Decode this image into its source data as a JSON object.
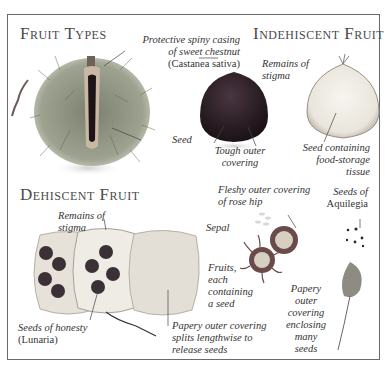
{
  "sections": {
    "fruit_types": {
      "title": "Fruit Types",
      "labels": {
        "casing_line1": "Protective spiny casing",
        "casing_line2": "of sweet chestnut",
        "casing_latin": "(Castanea sativa)",
        "seed": "Seed"
      }
    },
    "indehiscent": {
      "title": "Indehiscent Fruit",
      "labels": {
        "stigma_line1": "Remains of",
        "stigma_line2": "stigma",
        "tough_line1": "Tough outer",
        "tough_line2": "covering",
        "seedfood_line1": "Seed containing",
        "seedfood_line2": "food-storage",
        "seedfood_line3": "tissue"
      }
    },
    "dehiscent": {
      "title": "Dehiscent Fruit",
      "labels": {
        "stigma_line1": "Remains of",
        "stigma_line2": "stigma",
        "honesty_line1": "Seeds of honesty",
        "honesty_latin": "(Lunaria)",
        "papery_line1": "Papery outer covering",
        "papery_line2": "splits lengthwise to",
        "papery_line3": "release seeds"
      }
    },
    "rosehip": {
      "labels": {
        "fleshy_line1": "Fleshy outer covering",
        "fleshy_line2": "of rose hip",
        "sepal": "Sepal",
        "fruits_line1": "Fruits,",
        "fruits_line2": "each",
        "fruits_line3": "containing",
        "fruits_line4": "a seed"
      }
    },
    "aquilegia": {
      "labels": {
        "seeds_line1": "Seeds of",
        "seeds_line2": "Aquilegia",
        "papery_line1": "Papery",
        "papery_line2": "outer",
        "papery_line3": "covering",
        "papery_line4": "enclosing",
        "papery_line5": "many",
        "papery_line6": "seeds"
      }
    }
  },
  "colors": {
    "frame": "#6a6a6a",
    "chestnut_spines": "#8a8f7a",
    "chestnut_nut": "#2a1c22",
    "honesty_pod": "#e6e2da",
    "honesty_seed": "#3a3035",
    "rosehip": "#6b4a4a"
  }
}
